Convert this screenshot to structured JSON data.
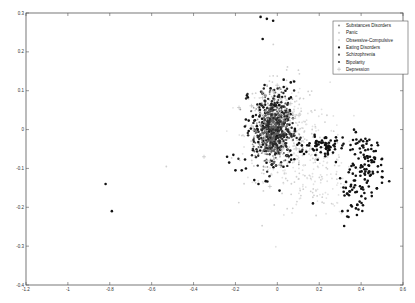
{
  "chart_data": {
    "type": "scatter",
    "title": "",
    "xlabel": "",
    "ylabel": "",
    "xlim": [
      -1.2,
      0.6
    ],
    "ylim": [
      -0.4,
      0.3
    ],
    "x_ticks": [
      -1.2,
      -1,
      -0.8,
      -0.6,
      -0.4,
      -0.2,
      0,
      0.2,
      0.4,
      0.6
    ],
    "x_tick_labels": [
      "-1.2",
      "-1",
      "-0.8",
      "-0.6",
      "-0.4",
      "-0.2",
      "0",
      "0.2",
      "0.4",
      "0.6"
    ],
    "y_ticks": [
      0.3,
      0.2,
      0.1,
      0,
      -0.1,
      -0.2,
      -0.3,
      -0.4
    ],
    "y_tick_labels": [
      "0.3",
      "0.2",
      "0.1",
      "0",
      "-0.1",
      "-0.2",
      "-0.3",
      "-0.4"
    ],
    "grid": false,
    "legend_position": "upper right",
    "series": [
      {
        "name": "Substances Disorders",
        "marker": "dot",
        "color": "#9a9a9a",
        "size": 0.9,
        "clusters": [
          {
            "n": 260,
            "cx": -0.02,
            "cy": 0.0,
            "sx": 0.045,
            "sy": 0.045
          }
        ]
      },
      {
        "name": "Panic",
        "marker": "dot",
        "color": "#d0d0d0",
        "size": 0.9,
        "clusters": [
          {
            "n": 200,
            "cx": 0.02,
            "cy": -0.01,
            "sx": 0.09,
            "sy": 0.07
          },
          {
            "n": 60,
            "cx": 0.18,
            "cy": -0.1,
            "sx": 0.08,
            "sy": 0.05
          }
        ]
      },
      {
        "name": "Obsessive-Compulsive",
        "marker": "dot",
        "color": "#e2e2e2",
        "size": 0.9,
        "clusters": [
          {
            "n": 200,
            "cx": 0.05,
            "cy": -0.02,
            "sx": 0.1,
            "sy": 0.07
          },
          {
            "n": 80,
            "cx": 0.2,
            "cy": -0.12,
            "sx": 0.09,
            "sy": 0.05
          }
        ]
      },
      {
        "name": "Eating Disorders",
        "marker": "dot",
        "color": "#111111",
        "size": 1.3,
        "clusters": [
          {
            "n": 140,
            "cx": -0.02,
            "cy": 0.0,
            "sx": 0.06,
            "sy": 0.06
          },
          {
            "n": 70,
            "cx": 0.22,
            "cy": -0.04,
            "sx": 0.06,
            "sy": 0.012
          },
          {
            "n": 90,
            "cx": 0.43,
            "cy": -0.09,
            "sx": 0.04,
            "sy": 0.04
          },
          {
            "n": 40,
            "cx": 0.37,
            "cy": -0.16,
            "sx": 0.04,
            "sy": 0.03
          }
        ]
      },
      {
        "name": "Schizophrenia",
        "marker": "dot",
        "color": "#5e5e5e",
        "size": 1.0,
        "clusters": [
          {
            "n": 380,
            "cx": -0.02,
            "cy": 0.0,
            "sx": 0.035,
            "sy": 0.037
          }
        ]
      },
      {
        "name": "Bipolarity",
        "marker": "dot",
        "color": "#2a2a2a",
        "size": 1.2,
        "clusters": [
          {
            "n": 160,
            "cx": -0.02,
            "cy": 0.0,
            "sx": 0.05,
            "sy": 0.05
          }
        ]
      },
      {
        "name": "Depression",
        "marker": "plus",
        "color": "#b5b5b5",
        "size": 2.0,
        "clusters": [
          {
            "n": 25,
            "cx": 0.0,
            "cy": 0.02,
            "sx": 0.07,
            "sy": 0.07
          }
        ]
      }
    ],
    "outliers": [
      {
        "series": "Eating Disorders",
        "x": -0.08,
        "y": 0.29
      },
      {
        "series": "Eating Disorders",
        "x": -0.05,
        "y": 0.285
      },
      {
        "series": "Eating Disorders",
        "x": -0.02,
        "y": 0.28
      },
      {
        "series": "Eating Disorders",
        "x": -0.07,
        "y": 0.233
      },
      {
        "series": "Eating Disorders",
        "x": -0.82,
        "y": -0.14
      },
      {
        "series": "Eating Disorders",
        "x": -0.79,
        "y": -0.21
      },
      {
        "series": "Panic",
        "x": -0.53,
        "y": -0.095
      },
      {
        "series": "Depression",
        "x": -0.35,
        "y": -0.07
      },
      {
        "series": "Depression",
        "x": -0.06,
        "y": 0.09
      },
      {
        "series": "Eating Disorders",
        "x": -0.24,
        "y": -0.07
      },
      {
        "series": "Eating Disorders",
        "x": -0.23,
        "y": -0.085
      },
      {
        "series": "Eating Disorders",
        "x": -0.21,
        "y": -0.065
      },
      {
        "series": "Eating Disorders",
        "x": -0.2,
        "y": -0.105
      },
      {
        "series": "Eating Disorders",
        "x": -0.17,
        "y": -0.105
      },
      {
        "series": "Eating Disorders",
        "x": -0.15,
        "y": -0.1
      },
      {
        "series": "Eating Disorders",
        "x": -0.11,
        "y": -0.13
      },
      {
        "series": "Eating Disorders",
        "x": -0.09,
        "y": -0.14
      },
      {
        "series": "Eating Disorders",
        "x": 0.17,
        "y": -0.19
      },
      {
        "series": "Eating Disorders",
        "x": 0.31,
        "y": -0.21
      },
      {
        "series": "Eating Disorders",
        "x": 0.34,
        "y": -0.225
      },
      {
        "series": "Eating Disorders",
        "x": 0.38,
        "y": -0.22
      },
      {
        "series": "Eating Disorders",
        "x": 0.47,
        "y": -0.055
      },
      {
        "series": "Eating Disorders",
        "x": 0.5,
        "y": -0.075
      }
    ]
  },
  "legend": {
    "entries": [
      {
        "label": "Substances Disorders",
        "marker": "dot",
        "color": "#9a9a9a"
      },
      {
        "label": "Panic",
        "marker": "dot",
        "color": "#d0d0d0"
      },
      {
        "label": "Obsessive-Compulsive",
        "marker": "dot",
        "color": "#e2e2e2"
      },
      {
        "label": "Eating Disorders",
        "marker": "dot",
        "color": "#111111"
      },
      {
        "label": "Schizophrenia",
        "marker": "dot",
        "color": "#5e5e5e"
      },
      {
        "label": "Bipolarity",
        "marker": "dot",
        "color": "#2a2a2a"
      },
      {
        "label": "Depression",
        "marker": "plus",
        "color": "#b5b5b5"
      }
    ]
  },
  "layout": {
    "plot_left": 26,
    "plot_right": 403,
    "plot_top": 13,
    "plot_bottom": 285,
    "frame_color": "#555555"
  }
}
